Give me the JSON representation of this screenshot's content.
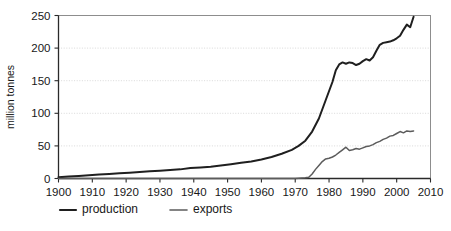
{
  "chart_data": {
    "type": "line",
    "title": "",
    "xlabel": "",
    "ylabel": "million tonnes",
    "xlim": [
      1900,
      2010
    ],
    "ylim": [
      0,
      250
    ],
    "grid": true,
    "legend_position": "bottom-left",
    "xticks": [
      1900,
      1910,
      1920,
      1930,
      1940,
      1950,
      1960,
      1970,
      1980,
      1990,
      2000,
      2010
    ],
    "xtick_labels": [
      "1900",
      "1910",
      "1920",
      "1930",
      "1940",
      "1950",
      "1960",
      "1970",
      "1980",
      "1990",
      "2000",
      "2010"
    ],
    "yticks": [
      0,
      50,
      100,
      150,
      200,
      250
    ],
    "ytick_labels": [
      "0",
      "50",
      "100",
      "150",
      "200",
      "250"
    ],
    "series": [
      {
        "name": "production",
        "color": "#1f1f1f",
        "width": 2.0,
        "x": [
          1900,
          1903,
          1906,
          1909,
          1912,
          1915,
          1918,
          1921,
          1924,
          1927,
          1930,
          1933,
          1936,
          1939,
          1942,
          1945,
          1948,
          1951,
          1954,
          1957,
          1960,
          1963,
          1966,
          1969,
          1971,
          1973,
          1975,
          1977,
          1979,
          1981,
          1982,
          1983,
          1984,
          1985,
          1986,
          1987,
          1988,
          1989,
          1990,
          1991,
          1992,
          1993,
          1994,
          1995,
          1996,
          1997,
          1998,
          1999,
          2000,
          2001,
          2002,
          2003,
          2004,
          2005
        ],
        "y": [
          2,
          3,
          4,
          5,
          6,
          7,
          8,
          9,
          10,
          11,
          12,
          13,
          14,
          16,
          17,
          18,
          20,
          22,
          24,
          26,
          29,
          33,
          38,
          44,
          50,
          58,
          72,
          92,
          120,
          148,
          166,
          175,
          178,
          176,
          178,
          177,
          174,
          176,
          180,
          183,
          181,
          186,
          196,
          205,
          208,
          209,
          210,
          212,
          215,
          219,
          228,
          236,
          232,
          248
        ]
      },
      {
        "name": "exports",
        "color": "#5c5c5c",
        "width": 1.5,
        "x": [
          1900,
          1920,
          1940,
          1955,
          1965,
          1970,
          1973,
          1974,
          1975,
          1976,
          1977,
          1978,
          1979,
          1980,
          1981,
          1982,
          1983,
          1984,
          1985,
          1986,
          1987,
          1988,
          1989,
          1990,
          1991,
          1992,
          1993,
          1994,
          1995,
          1996,
          1997,
          1998,
          1999,
          2000,
          2001,
          2002,
          2003,
          2004,
          2005
        ],
        "y": [
          0,
          0,
          0,
          0,
          0,
          0,
          1,
          2,
          7,
          14,
          20,
          26,
          30,
          31,
          33,
          36,
          40,
          44,
          48,
          43,
          44,
          46,
          45,
          47,
          49,
          50,
          52,
          55,
          57,
          60,
          62,
          65,
          66,
          69,
          72,
          70,
          73,
          72,
          73
        ]
      }
    ]
  },
  "legend": {
    "items": [
      {
        "label": "production",
        "color": "#1f1f1f"
      },
      {
        "label": "exports",
        "color": "#5c5c5c"
      }
    ]
  }
}
